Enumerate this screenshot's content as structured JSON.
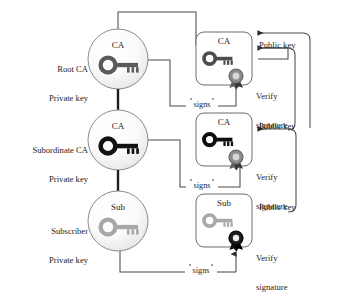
{
  "diagram": {
    "type": "diagram",
    "background": "#ffffff",
    "line_color": "#3b3b3b",
    "text_color": "#1c1c1c"
  },
  "entities": [
    {
      "id": "root-ca",
      "name_line1": "Root CA",
      "name_line2": "Private key",
      "node_label": "CA",
      "key_color": "#5a5a5a",
      "icon": "key-icon"
    },
    {
      "id": "subordinate-ca",
      "name_line1": "Subordinate CA",
      "name_line2": "Private key",
      "node_label": "CA",
      "key_color": "#121212",
      "icon": "key-icon"
    },
    {
      "id": "subscriber",
      "name_line1": "Subscriber",
      "name_line2": "Private key",
      "node_label": "Sub",
      "key_color": "#a8a8a8",
      "icon": "key-icon"
    }
  ],
  "certificates": [
    {
      "id": "root-cert",
      "node_label": "CA",
      "key_color": "#4d4d4d",
      "seal_color": "#6e6e6e",
      "public_key_label": "Public key",
      "verify_label_line1": "Verify",
      "verify_label_line2": "signature",
      "signs_label": "signs"
    },
    {
      "id": "subordinate-cert",
      "node_label": "CA",
      "key_color": "#0d0d0d",
      "seal_color": "#6e6e6e",
      "public_key_label": "Public key",
      "verify_label_line1": "Verify",
      "verify_label_line2": "signature",
      "signs_label": "signs"
    },
    {
      "id": "subscriber-cert",
      "node_label": "Sub",
      "key_color": "#a8a8a8",
      "seal_color": "#111111",
      "public_key_label": "Public key",
      "verify_label_line1": "Verify",
      "verify_label_line2": "signature",
      "signs_label": "signs"
    }
  ]
}
